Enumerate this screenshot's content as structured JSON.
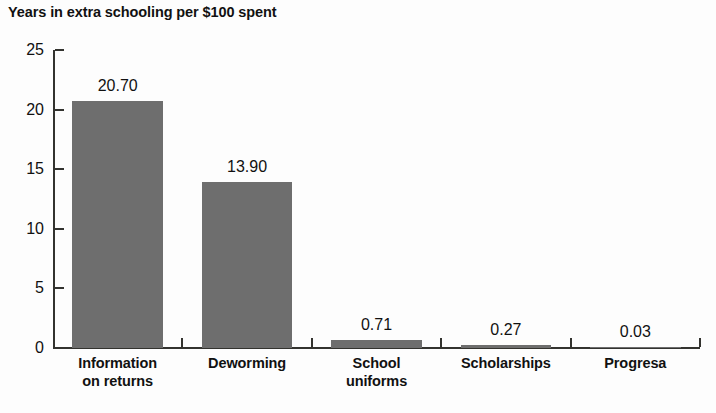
{
  "chart_data": {
    "type": "bar",
    "title": "Years in extra schooling per $100 spent",
    "subtitle": "",
    "xlabel": "",
    "ylabel": "",
    "categories": [
      "Information\non returns",
      "Deworming",
      "School\nuniforms",
      "Scholarships",
      "Progresa"
    ],
    "values": [
      20.7,
      13.9,
      0.71,
      0.27,
      0.03
    ],
    "value_labels": [
      "20.70",
      "13.90",
      "0.71",
      "0.27",
      "0.03"
    ],
    "ylim": [
      0,
      25
    ],
    "yticks": [
      0,
      5,
      10,
      15,
      20,
      25
    ],
    "ytick_labels": [
      "0",
      "5",
      "10",
      "15",
      "20",
      "25"
    ],
    "grid": false,
    "legend": false,
    "legend_position": "none",
    "bar_color": "#6e6e6e",
    "axis_color": "#33332f",
    "background_color": "#fdfdfd",
    "text_color": "#111111"
  }
}
